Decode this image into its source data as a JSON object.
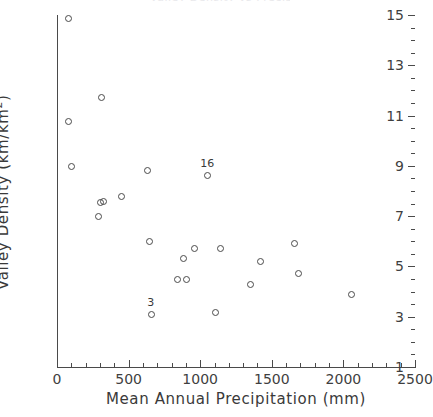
{
  "chart_data": {
    "type": "scatter",
    "title": "Valley Density vs Precipitation",
    "xlabel": "Mean Annual Precipitation (mm)",
    "ylabel": "Valley Density (km/km",
    "ylabel_sup": "2",
    "ylabel_tail": ")",
    "xlim": [
      0,
      2500
    ],
    "ylim": [
      1,
      15
    ],
    "grid": false,
    "legend": "none",
    "xticks": [
      0,
      500,
      1000,
      1500,
      2000,
      2500
    ],
    "xtick_labels": [
      "0",
      "500",
      "1000",
      "1500",
      "2000",
      "2500"
    ],
    "x_minor_step": 100,
    "yticks": [
      1,
      3,
      5,
      7,
      9,
      11,
      13,
      15
    ],
    "ytick_labels": [
      "1",
      "3",
      "5",
      "7",
      "9",
      "11",
      "13",
      "15"
    ],
    "y_minor_step": 0.5,
    "marker": "open-circle",
    "marker_color": "#4a4a4a",
    "points": [
      {
        "x": 75,
        "y": 14.9,
        "label": ""
      },
      {
        "x": 80,
        "y": 10.8,
        "label": ""
      },
      {
        "x": 100,
        "y": 9.0,
        "label": ""
      },
      {
        "x": 310,
        "y": 11.75,
        "label": ""
      },
      {
        "x": 300,
        "y": 7.55,
        "label": ""
      },
      {
        "x": 320,
        "y": 7.6,
        "label": ""
      },
      {
        "x": 285,
        "y": 7.0,
        "label": ""
      },
      {
        "x": 450,
        "y": 7.8,
        "label": ""
      },
      {
        "x": 625,
        "y": 8.85,
        "label": ""
      },
      {
        "x": 640,
        "y": 6.0,
        "label": ""
      },
      {
        "x": 655,
        "y": 3.1,
        "label": "3"
      },
      {
        "x": 840,
        "y": 4.5,
        "label": ""
      },
      {
        "x": 880,
        "y": 5.35,
        "label": ""
      },
      {
        "x": 900,
        "y": 4.5,
        "label": ""
      },
      {
        "x": 960,
        "y": 5.75,
        "label": ""
      },
      {
        "x": 1050,
        "y": 8.65,
        "label": "16"
      },
      {
        "x": 1100,
        "y": 3.2,
        "label": ""
      },
      {
        "x": 1140,
        "y": 5.75,
        "label": ""
      },
      {
        "x": 1350,
        "y": 4.3,
        "label": ""
      },
      {
        "x": 1420,
        "y": 5.2,
        "label": ""
      },
      {
        "x": 1655,
        "y": 5.95,
        "label": ""
      },
      {
        "x": 1680,
        "y": 4.75,
        "label": ""
      },
      {
        "x": 2050,
        "y": 3.9,
        "label": ""
      }
    ]
  }
}
